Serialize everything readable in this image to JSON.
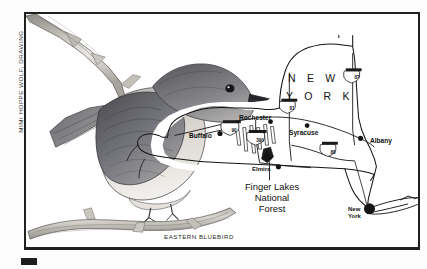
{
  "artwork": {
    "title": "Eastern Bluebird illustration with New York state map",
    "credit_vertical": "MIMI HOPPE WOLF, DRAWING",
    "caption": "EASTERN BLUEBIRD",
    "bird_subject": "eastern-bluebird-perched-on-branch"
  },
  "map": {
    "state_label": "N E W   Y O R K",
    "state_label_line1": "N E W",
    "state_label_line2": "Y O R K",
    "cities": [
      {
        "name": "Buffalo",
        "x": 176,
        "y": 122
      },
      {
        "name": "Rochester",
        "x": 226,
        "y": 106
      },
      {
        "name": "Syracuse",
        "x": 284,
        "y": 119
      },
      {
        "name": "Albany",
        "x": 352,
        "y": 124
      },
      {
        "name": "Elmira",
        "x": 235,
        "y": 156
      }
    ],
    "nyc_label_line1": "New",
    "nyc_label_line2": "York",
    "forest_label_line1": "Finger Lakes",
    "forest_label_line2": "National",
    "forest_label_line3": "Forest",
    "highways": [
      {
        "number": "90",
        "x": 204,
        "y": 112
      },
      {
        "number": "81",
        "x": 255,
        "y": 93
      },
      {
        "number": "87",
        "x": 330,
        "y": 62
      },
      {
        "number": "88",
        "x": 305,
        "y": 138
      },
      {
        "number": "390",
        "x": 233,
        "y": 125
      }
    ]
  },
  "colors": {
    "frame": "#20201f",
    "ink": "#151515",
    "paper": "#ffffff",
    "page_bg": "#fdfdfd"
  }
}
